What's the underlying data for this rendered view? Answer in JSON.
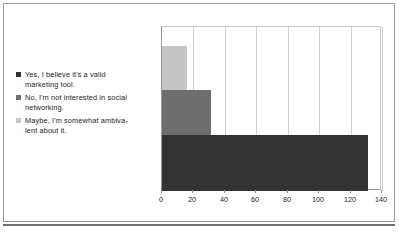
{
  "figure": {
    "caption": "Figure - survey responses",
    "caption_visible": false
  },
  "chart_data": {
    "type": "bar",
    "orientation": "horizontal",
    "title": "",
    "xlabel": "",
    "ylabel": "",
    "xlim": [
      0,
      140
    ],
    "xticks": [
      0,
      20,
      40,
      60,
      80,
      100,
      120,
      140
    ],
    "xtick_labels": [
      "0",
      "20",
      "40",
      "60",
      "80",
      "100",
      "120",
      "140"
    ],
    "grid": true,
    "grid_axis": "x",
    "legend_position": "left",
    "categories": [
      "Yes, I believe it's a valid marketing tool.",
      "No, I'm not interested in social networking.",
      "Maybe, I'm somewhat ambivalent about it."
    ],
    "values": [
      131,
      31,
      16
    ],
    "colors": [
      "#333333",
      "#6e6e6e",
      "#c6c6c6"
    ],
    "bars": [
      {
        "label": "Maybe, I'm somewhat ambivalent about it.",
        "value": 16,
        "color": "#c6c6c6"
      },
      {
        "label": "No, I'm not interested in social networking.",
        "value": 31,
        "color": "#6e6e6e"
      },
      {
        "label": "Yes, I believe it's a valid marketing tool.",
        "value": 131,
        "color": "#333333"
      }
    ]
  },
  "legend": {
    "items": [
      {
        "color": "#333333",
        "line1": "Yes, I believe it's a valid",
        "line2": "marketing tool."
      },
      {
        "color": "#6e6e6e",
        "line1": "No, I'm not interested in social",
        "line2": "networking."
      },
      {
        "color": "#c6c6c6",
        "line1": "Maybe, I'm somewhat ambiva-",
        "line2": "lent about it."
      }
    ]
  },
  "axis": {
    "ticks": [
      "0",
      "20",
      "40",
      "60",
      "80",
      "100",
      "120",
      "140"
    ]
  }
}
